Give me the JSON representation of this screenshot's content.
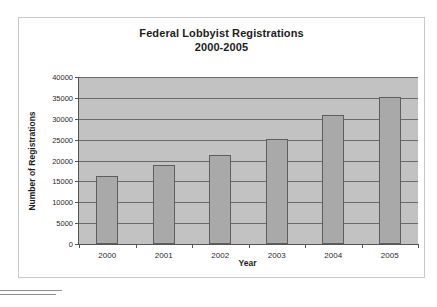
{
  "chart_data": {
    "type": "bar",
    "title": "Federal Lobbyist Registrations",
    "subtitle": "2000-2005",
    "xlabel": "Year",
    "ylabel": "Number of Registrations",
    "categories": [
      "2000",
      "2001",
      "2002",
      "2003",
      "2004",
      "2005"
    ],
    "values": [
      16400,
      19000,
      21300,
      25200,
      30800,
      35300
    ],
    "ylim": [
      0,
      40000
    ],
    "ytick_step": 5000,
    "yticks": [
      "40000",
      "35000",
      "30000",
      "25000",
      "20000",
      "15000",
      "10000",
      "5000",
      "0"
    ],
    "ytick_values": [
      40000,
      35000,
      30000,
      25000,
      20000,
      15000,
      10000,
      5000,
      0
    ],
    "grid": true,
    "legend": false,
    "colors": {
      "bar_fill": "#a9a9a9",
      "bar_border": "#5e5e5e",
      "plot_background": "#c2c2c2",
      "gridline": "#6a6a6a",
      "axis": "#555555",
      "text": "#1c1c1c",
      "page_border": "#c9c9c9"
    }
  }
}
